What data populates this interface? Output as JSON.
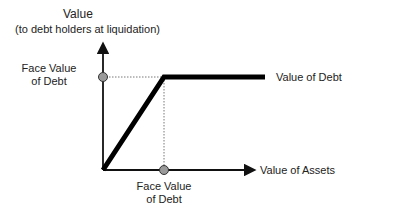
{
  "diagram": {
    "y_axis": {
      "title": "Value",
      "subtitle": "(to debt holders at liquidation)",
      "marker_label_line1": "Face Value",
      "marker_label_line2": "of Debt"
    },
    "x_axis": {
      "title": "Value of Assets",
      "marker_label_line1": "Face Value",
      "marker_label_line2": "of Debt"
    },
    "curve_label": "Value of Debt",
    "colors": {
      "axis": "#111111",
      "curve": "#000000",
      "marker_fill": "#9a9a9a",
      "guide": "#555555"
    }
  }
}
